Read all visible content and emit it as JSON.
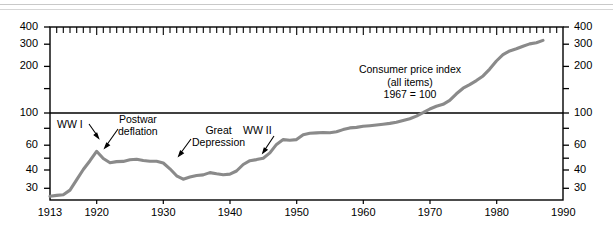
{
  "figure": {
    "name": "consumer-price-index-figure",
    "top_rules": 2,
    "curve_color": "#8a8a8a",
    "axis_color": "#000000",
    "background": "#ffffff"
  },
  "title_block": {
    "line1": "Consumer price index",
    "line2": "(all items)",
    "line3": "1967 = 100"
  },
  "annotations": [
    {
      "id": "ww1",
      "label": "WW I"
    },
    {
      "id": "postwar-deflation",
      "label_line1": "Postwar",
      "label_line2": "deflation"
    },
    {
      "id": "great-depression",
      "label_line1": "Great",
      "label_line2": "Depression"
    },
    {
      "id": "ww2",
      "label": "WW II"
    }
  ],
  "axes": {
    "y_left_ticks": [
      "400",
      "300",
      "200",
      "100",
      "60",
      "40",
      "30"
    ],
    "y_right_ticks": [
      "400",
      "300",
      "200",
      "100",
      "60",
      "40",
      "30"
    ],
    "x_ticks": [
      "1913",
      "1920",
      "1930",
      "1940",
      "1950",
      "1960",
      "1970",
      "1980",
      "1990"
    ]
  },
  "chart_data": {
    "type": "line",
    "subtitle": "1967 = 100",
    "xlabel": "",
    "ylabel": "Consumer price index (1967 = 100)",
    "yscale": "log",
    "ylim": [
      28,
      420
    ],
    "xlim": [
      1913,
      1990
    ],
    "grid": false,
    "legend": null,
    "ytick_values": [
      30,
      40,
      60,
      100,
      200,
      300,
      400
    ],
    "ytick_labels": [
      "30",
      "40",
      "60",
      "100",
      "200",
      "300",
      "400"
    ],
    "xtick_values": [
      1913,
      1920,
      1930,
      1940,
      1950,
      1960,
      1970,
      1980,
      1990
    ],
    "xtick_labels": [
      "1913",
      "1920",
      "1930",
      "1940",
      "1950",
      "1960",
      "1970",
      "1980",
      "1990"
    ],
    "reference_line": {
      "y": 100,
      "label": "1967 = 100"
    },
    "series": [
      {
        "name": "Consumer price index (all items)",
        "color": "#8a8a8a",
        "x": [
          1913,
          1914,
          1915,
          1916,
          1917,
          1918,
          1919,
          1920,
          1921,
          1922,
          1923,
          1924,
          1925,
          1926,
          1927,
          1928,
          1929,
          1930,
          1931,
          1932,
          1933,
          1934,
          1935,
          1936,
          1937,
          1938,
          1939,
          1940,
          1941,
          1942,
          1943,
          1944,
          1945,
          1946,
          1947,
          1948,
          1949,
          1950,
          1951,
          1952,
          1953,
          1954,
          1955,
          1956,
          1957,
          1958,
          1959,
          1960,
          1961,
          1962,
          1963,
          1964,
          1965,
          1966,
          1967,
          1968,
          1969,
          1970,
          1971,
          1972,
          1973,
          1974,
          1975,
          1976,
          1977,
          1978,
          1979,
          1980,
          1981,
          1982,
          1983,
          1984,
          1985,
          1986,
          1987
        ],
        "y": [
          29.7,
          30.1,
          30.4,
          32.7,
          38.4,
          45.1,
          51.8,
          60.0,
          53.6,
          50.2,
          51.1,
          51.2,
          52.5,
          53.0,
          52.0,
          51.3,
          51.3,
          50.0,
          45.6,
          40.9,
          38.8,
          40.1,
          41.1,
          41.5,
          43.0,
          42.2,
          41.6,
          42.0,
          44.1,
          48.8,
          51.8,
          52.7,
          53.9,
          58.5,
          66.9,
          72.1,
          71.4,
          72.1,
          77.8,
          79.5,
          80.1,
          80.5,
          80.2,
          81.4,
          84.3,
          86.6,
          87.3,
          88.7,
          89.6,
          90.6,
          91.7,
          92.9,
          94.5,
          97.2,
          100.0,
          104.2,
          109.8,
          116.3,
          121.3,
          125.3,
          133.1,
          147.7,
          161.2,
          170.5,
          181.5,
          195.4,
          217.4,
          246.8,
          272.4,
          289.1,
          298.4,
          311.1,
          322.2,
          328.4,
          340.4
        ]
      }
    ],
    "annotations": [
      {
        "text": "WW I",
        "x": 1918,
        "y": 60,
        "note": "arrow points to 1920 peak"
      },
      {
        "text": "Postwar deflation",
        "x": 1925,
        "y": 75,
        "note": "arrow points to 1921 drop"
      },
      {
        "text": "Great Depression",
        "x": 1936,
        "y": 68,
        "note": "arrow points to 1933 trough"
      },
      {
        "text": "WW II",
        "x": 1947,
        "y": 72,
        "note": "arrow points to 1942 rise"
      }
    ]
  }
}
